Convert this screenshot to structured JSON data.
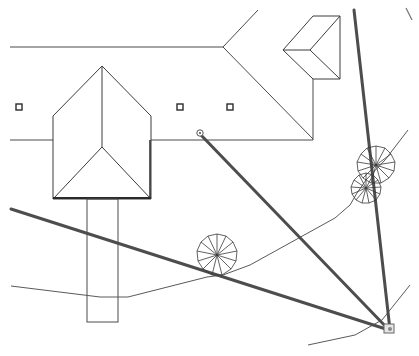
{
  "drawing": {
    "type": "site-plan-cad",
    "width": 419,
    "height": 356,
    "colors": {
      "background": "#ffffff",
      "line": "#4a4a4a",
      "heavy_line": "#4d4d4d",
      "station_fill": "#e6e6e6"
    },
    "building_main_outline": "10,45 225,45 232,0 M232,0 L225,45 M10,140 53,140 M150,140 200,140 305,140 305,82",
    "roof_wings": [
      {
        "name": "left-gable",
        "points": "53,115 102,66 150,115 150,199 53,199"
      },
      {
        "name": "right-gable",
        "points": "283,45 312,12 340,12 340,80 313,80"
      }
    ],
    "square_markers": [
      {
        "x": 19,
        "y": 108
      },
      {
        "x": 180,
        "y": 107
      },
      {
        "x": 230,
        "y": 107
      }
    ],
    "survey_lines": [
      {
        "name": "survey-line-northwest",
        "x1": 200,
        "y1": 133,
        "x2": 389,
        "y2": 329
      },
      {
        "name": "survey-line-west",
        "x1": 11,
        "y1": 210,
        "x2": 389,
        "y2": 329
      },
      {
        "name": "survey-line-north",
        "x1": 353,
        "y1": 10,
        "x2": 389,
        "y2": 329
      }
    ],
    "trees": [
      {
        "cx": 217,
        "cy": 255,
        "r": 21
      },
      {
        "cx": 376,
        "cy": 165,
        "r": 19
      },
      {
        "cx": 366,
        "cy": 188,
        "r": 15
      }
    ],
    "station_point": {
      "x": 389,
      "y": 329,
      "label": "station"
    },
    "origin_point": {
      "x": 200,
      "y": 133,
      "label": "origin"
    }
  }
}
